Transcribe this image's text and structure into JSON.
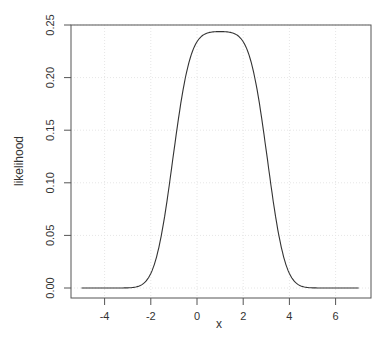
{
  "chart_data": {
    "type": "line",
    "title": "",
    "xlabel": "x",
    "ylabel": "likelihood",
    "xlim": [
      -5.5,
      7.5
    ],
    "ylim": [
      0,
      0.25
    ],
    "x_ticks": [
      -4,
      -2,
      0,
      2,
      4,
      6
    ],
    "x_tick_labels": [
      "-4",
      "-2",
      "0",
      "2",
      "4",
      "6"
    ],
    "y_ticks": [
      0.0,
      0.05,
      0.1,
      0.15,
      0.2,
      0.25
    ],
    "y_tick_labels": [
      "0.00",
      "0.05",
      "0.10",
      "0.15",
      "0.20",
      "0.25"
    ],
    "grid": true,
    "legend": null,
    "series": [
      {
        "name": "likelihood",
        "color": "#333333",
        "x": [
          -5,
          -4.5,
          -4,
          -3.5,
          -3,
          -2.75,
          -2.5,
          -2.25,
          -2,
          -1.75,
          -1.5,
          -1.25,
          -1,
          -0.75,
          -0.5,
          -0.25,
          0,
          0.25,
          0.5,
          0.75,
          1,
          1.25,
          1.5,
          1.75,
          2,
          2.25,
          2.5,
          2.75,
          3,
          3.25,
          3.5,
          3.75,
          4,
          4.25,
          4.5,
          4.75,
          5,
          5.5,
          6,
          6.5,
          7
        ],
        "values": [
          0.0,
          0.0,
          0.0,
          0.0003,
          0.0029,
          0.0069,
          0.0151,
          0.0298,
          0.0532,
          0.0863,
          0.1273,
          0.1716,
          0.1219,
          0.1653,
          0.2028,
          0.228,
          0.2402,
          0.2433,
          0.2439,
          0.2439,
          0.2439,
          0.2439,
          0.2439,
          0.2433,
          0.2402,
          0.228,
          0.2028,
          0.1653,
          0.1219,
          0.0812,
          0.048,
          0.025,
          0.0114,
          0.0045,
          0.0015,
          0.0004,
          0.0001,
          0.0,
          0.0,
          0.0,
          0.0
        ]
      }
    ]
  }
}
